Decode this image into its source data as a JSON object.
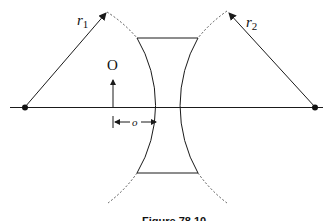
{
  "figure": {
    "caption": "Figure 78.10",
    "type": "thin diverging (biconcave) lens diagram",
    "labels": {
      "radius_left": "r",
      "radius_left_sub": "1",
      "radius_right": "r",
      "radius_right_sub": "2",
      "object": "O",
      "object_distance": "o"
    },
    "colors": {
      "line": "#1a1a1a",
      "dashed": "#555555",
      "background": "#ffffff"
    }
  }
}
